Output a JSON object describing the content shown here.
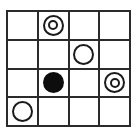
{
  "puzzle": {
    "type": "grid-circle-puzzle",
    "rows": 4,
    "columns": 4,
    "background_color": "#ffffff",
    "line_color": "#2b2b2b",
    "mark_color": "#1a1a1a",
    "fill_color": "#0d0d0d",
    "legend": {
      "empty": "empty-cell",
      "circle": "open-circle",
      "double_circle": "concentric-double-circle",
      "filled_circle": "filled-black-circle"
    },
    "cells": [
      [
        {
          "mark": "empty",
          "name": "cell-r1c1"
        },
        {
          "mark": "double_circle",
          "name": "cell-r1c2"
        },
        {
          "mark": "empty",
          "name": "cell-r1c3"
        },
        {
          "mark": "empty",
          "name": "cell-r1c4"
        }
      ],
      [
        {
          "mark": "empty",
          "name": "cell-r2c1"
        },
        {
          "mark": "empty",
          "name": "cell-r2c2"
        },
        {
          "mark": "circle",
          "name": "cell-r2c3"
        },
        {
          "mark": "empty",
          "name": "cell-r2c4"
        }
      ],
      [
        {
          "mark": "empty",
          "name": "cell-r3c1"
        },
        {
          "mark": "filled_circle",
          "name": "cell-r3c2"
        },
        {
          "mark": "empty",
          "name": "cell-r3c3"
        },
        {
          "mark": "double_circle",
          "name": "cell-r3c4"
        }
      ],
      [
        {
          "mark": "circle",
          "name": "cell-r4c1"
        },
        {
          "mark": "empty",
          "name": "cell-r4c2"
        },
        {
          "mark": "empty",
          "name": "cell-r4c3"
        },
        {
          "mark": "empty",
          "name": "cell-r4c4"
        }
      ]
    ]
  }
}
